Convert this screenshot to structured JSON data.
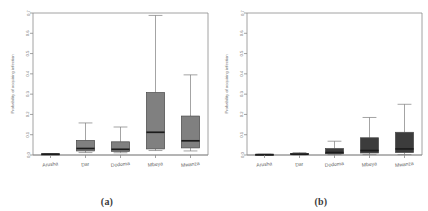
{
  "figure": {
    "background": "#ffffff",
    "panels": [
      {
        "caption": "(a)",
        "name": "panel-a"
      },
      {
        "caption": "(b)",
        "name": "panel-b"
      }
    ]
  },
  "chart_data": [
    {
      "type": "box",
      "panel": "(a)",
      "title": "",
      "xlabel": "",
      "ylabel": "Probability of acquiring infection",
      "categories": [
        "Arusha",
        "Dar",
        "Dodoma",
        "Mbeya",
        "Mwanza"
      ],
      "ylim": [
        0.0,
        0.7
      ],
      "yticks": [
        0.0,
        0.1,
        0.2,
        0.3,
        0.4,
        0.5,
        0.6,
        0.7
      ],
      "ytick_labels": [
        "0.0",
        "0.1",
        "0.2",
        "0.3",
        "0.4",
        "0.5",
        "0.6",
        "0.7"
      ],
      "grid": false,
      "legend": "none",
      "box_color": "#808080",
      "median_color": "#1c1c1c",
      "boxes": [
        {
          "category": "Arusha",
          "whisker_low": 0.002,
          "q1": 0.003,
          "median": 0.004,
          "q3": 0.006,
          "whisker_high": 0.007
        },
        {
          "category": "Dar",
          "whisker_low": 0.012,
          "q1": 0.02,
          "median": 0.032,
          "q3": 0.072,
          "whisker_high": 0.158
        },
        {
          "category": "Dodoma",
          "whisker_low": 0.011,
          "q1": 0.018,
          "median": 0.028,
          "q3": 0.065,
          "whisker_high": 0.138
        },
        {
          "category": "Mbeya",
          "whisker_low": 0.022,
          "q1": 0.03,
          "median": 0.112,
          "q3": 0.308,
          "whisker_high": 0.688
        },
        {
          "category": "Mwanza",
          "whisker_low": 0.02,
          "q1": 0.035,
          "median": 0.07,
          "q3": 0.192,
          "whisker_high": 0.395
        }
      ]
    },
    {
      "type": "box",
      "panel": "(b)",
      "title": "",
      "xlabel": "",
      "ylabel": "Probability of acquiring infection",
      "categories": [
        "Arusha",
        "Dar",
        "Dodoma",
        "Mbeya",
        "Mwanza"
      ],
      "ylim": [
        0.0,
        0.7
      ],
      "yticks": [
        0.0,
        0.1,
        0.2,
        0.3,
        0.4,
        0.5,
        0.6,
        0.7
      ],
      "ytick_labels": [
        "0.0",
        "0.1",
        "0.2",
        "0.3",
        "0.4",
        "0.5",
        "0.6",
        "0.7"
      ],
      "grid": false,
      "legend": "none",
      "box_color": "#3c3c3c",
      "median_color": "#101010",
      "boxes": [
        {
          "category": "Arusha",
          "whisker_low": 0.0,
          "q1": 0.001,
          "median": 0.002,
          "q3": 0.003,
          "whisker_high": 0.004
        },
        {
          "category": "Dar",
          "whisker_low": 0.001,
          "q1": 0.002,
          "median": 0.004,
          "q3": 0.008,
          "whisker_high": 0.012
        },
        {
          "category": "Dodoma",
          "whisker_low": 0.002,
          "q1": 0.006,
          "median": 0.012,
          "q3": 0.032,
          "whisker_high": 0.068
        },
        {
          "category": "Mbeya",
          "whisker_low": 0.002,
          "q1": 0.01,
          "median": 0.022,
          "q3": 0.085,
          "whisker_high": 0.185
        },
        {
          "category": "Mwanza",
          "whisker_low": 0.002,
          "q1": 0.012,
          "median": 0.03,
          "q3": 0.112,
          "whisker_high": 0.25
        }
      ]
    }
  ]
}
